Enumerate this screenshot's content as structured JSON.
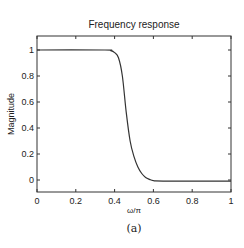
{
  "figure": {
    "caption": "(a)"
  },
  "chart_data": {
    "type": "line",
    "title": "Frequency response",
    "xlabel": "ω/π",
    "ylabel": "Magnitude",
    "xlim": [
      0,
      1
    ],
    "ylim": [
      -0.1,
      1.115
    ],
    "xticks": [
      0,
      0.2,
      0.4,
      0.6,
      0.8,
      1
    ],
    "xtick_labels": [
      "0",
      "0.2",
      "0.4",
      "0.6",
      "0.8",
      "1"
    ],
    "yticks": [
      0,
      0.2,
      0.4,
      0.6,
      0.8,
      1
    ],
    "ytick_labels": [
      "0",
      "0.2",
      "0.4",
      "0.6",
      "0.8",
      "1"
    ],
    "grid": false,
    "legend": null,
    "series": [
      {
        "name": "Magnitude",
        "color": "#333333",
        "x": [
          0,
          0.35,
          0.38,
          0.4,
          0.42,
          0.44,
          0.46,
          0.48,
          0.5,
          0.52,
          0.54,
          0.56,
          0.58,
          0.6,
          0.65,
          1.0
        ],
        "y": [
          1.0,
          1.0,
          0.995,
          0.98,
          0.94,
          0.8,
          0.52,
          0.3,
          0.18,
          0.1,
          0.05,
          0.02,
          0.005,
          -0.005,
          -0.008,
          -0.008
        ]
      }
    ]
  }
}
